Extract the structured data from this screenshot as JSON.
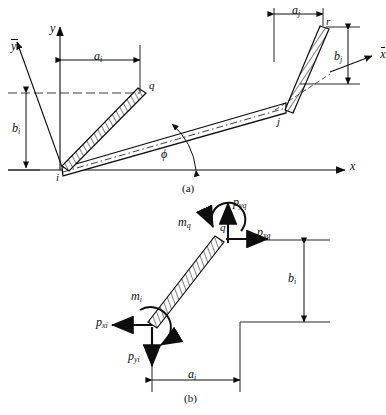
{
  "figure": {
    "panels": [
      {
        "id": "a",
        "caption": "(a)",
        "description": "Geometry: element i-j with rigid offsets i-q and j-r relative to global x-y axes"
      },
      {
        "id": "b",
        "caption": "(b)",
        "description": "Free-body of rigid offset segment i-q with end forces and moments"
      }
    ]
  },
  "panel_a": {
    "caption": "(a)",
    "axes": {
      "global_x": "x",
      "global_y": "y",
      "local_x": "x",
      "local_y": "y"
    },
    "nodes": {
      "i": "i",
      "j": "j",
      "q": "q",
      "r": "r"
    },
    "dimensions": {
      "a_i_label": "a",
      "a_i_sub": "i",
      "b_i_label": "b",
      "b_i_sub": "i",
      "a_j_label": "a",
      "a_j_sub": "j",
      "b_j_label": "b",
      "b_j_sub": "j"
    },
    "angle": "ϕ"
  },
  "panel_b": {
    "caption": "(b)",
    "nodes": {
      "i": "i",
      "q": "q"
    },
    "forces": [
      {
        "name": "p-yq",
        "sym": "p",
        "sub": "yq",
        "direction": "up",
        "at": "q"
      },
      {
        "name": "p-xq",
        "sym": "p",
        "sub": "xq",
        "direction": "right",
        "at": "q"
      },
      {
        "name": "m-q",
        "sym": "m",
        "sub": "q",
        "direction": "ccw",
        "at": "q"
      },
      {
        "name": "p-xi",
        "sym": "p",
        "sub": "xi",
        "direction": "left",
        "at": "i"
      },
      {
        "name": "p-yi",
        "sym": "p",
        "sub": "yi",
        "direction": "down",
        "at": "i"
      },
      {
        "name": "m-i",
        "sym": "m",
        "sub": "i",
        "direction": "ccw",
        "at": "i"
      }
    ],
    "dimensions": {
      "a_i_label": "a",
      "a_i_sub": "i",
      "b_i_label": "b",
      "b_i_sub": "i"
    }
  },
  "colors": {
    "ink": "#0d0d0d",
    "paper": "#ffffff",
    "hatch": "#1a1a1a"
  }
}
